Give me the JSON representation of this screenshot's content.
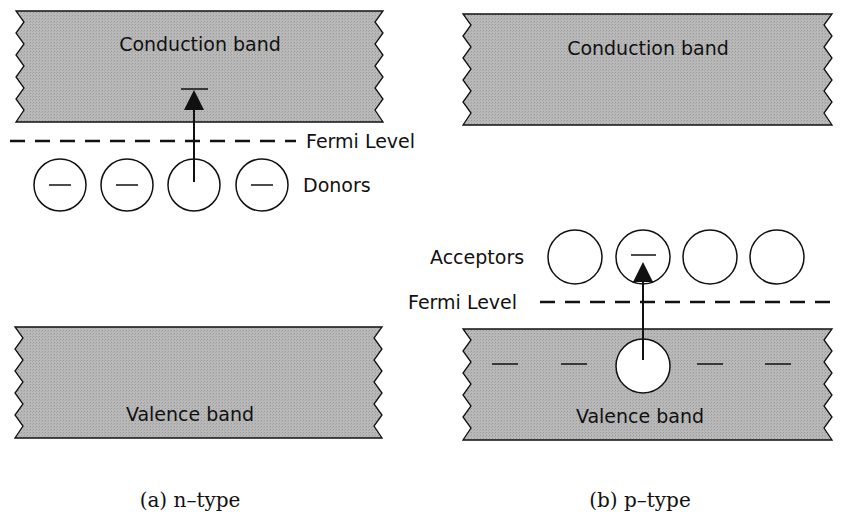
{
  "figure": {
    "panel_a": {
      "caption": "(a) n–type",
      "conduction_band_label": "Conduction band",
      "valence_band_label": "Valence band",
      "fermi_level_label": "Fermi Level",
      "impurity_label": "Donors"
    },
    "panel_b": {
      "caption": "(b) p–type",
      "conduction_band_label": "Conduction band",
      "valence_band_label": "Valence band",
      "fermi_level_label": "Fermi Level",
      "impurity_label": "Acceptors"
    },
    "colors": {
      "band_fill": "#b4b4b4",
      "line": "#111111",
      "background": "#ffffff"
    }
  }
}
